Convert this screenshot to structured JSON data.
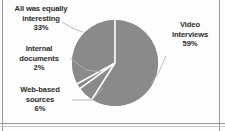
{
  "chart_data": {
    "type": "pie",
    "title": "",
    "categories": [
      "Video interviews",
      "Web-based sources",
      "Internal documents",
      "All was equally interesting"
    ],
    "values": [
      59,
      6,
      2,
      33
    ],
    "value_suffix": "%",
    "legend": "none",
    "labels_position": "outside-with-leader-lines",
    "start_angle_deg": 0,
    "direction": "clockwise",
    "slice_color": "#8a8a8a",
    "separator_color": "#ffffff",
    "leader_line_color": "#b4b4b4",
    "text_color": "#2b2b2b",
    "background": "#fdfdfd",
    "slices": [
      {
        "name": "video-interviews",
        "label_line1": "Video",
        "label_line2": "interviews",
        "value_label": "59%",
        "value": 59
      },
      {
        "name": "web-based-sources",
        "label_line1": "Web-based",
        "label_line2": "sources",
        "value_label": "6%",
        "value": 6
      },
      {
        "name": "internal-documents",
        "label_line1": "Internal",
        "label_line2": "documents",
        "value_label": "2%",
        "value": 2
      },
      {
        "name": "all-equally-interesting",
        "label_line1": "All was equally",
        "label_line2": "interesting",
        "value_label": "33%",
        "value": 33
      }
    ]
  }
}
